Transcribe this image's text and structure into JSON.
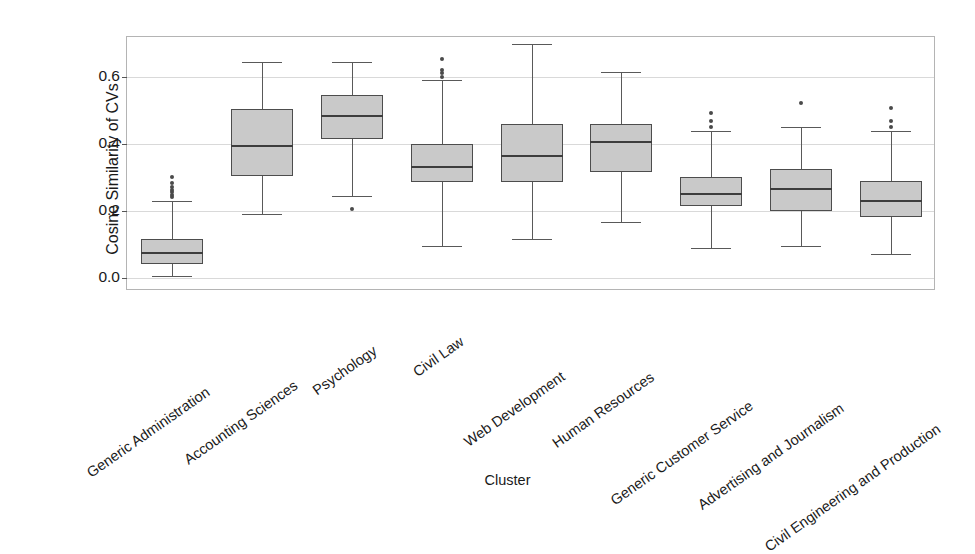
{
  "chart_data": {
    "type": "box",
    "title": "",
    "xlabel": "Cluster",
    "ylabel": "Cosine Similarity of CVs",
    "ylim": [
      -0.04,
      0.72
    ],
    "yticks": [
      0.0,
      0.2,
      0.4,
      0.6
    ],
    "ytick_labels": [
      "0.0",
      "0.2",
      "0.4",
      "0.6"
    ],
    "grid": true,
    "grid_axis": "y",
    "legend": "none",
    "xtick_rotation": -35,
    "categories": [
      "Generic Administration",
      "Accounting Sciences",
      "Psychology",
      "Civil Law",
      "Web Development",
      "Human Resources",
      "Generic Customer Service",
      "Advertising and Journalism",
      "Civil Engineering and Production"
    ],
    "boxes": [
      {
        "category": "Generic Administration",
        "whisker_low": 0.005,
        "q1": 0.04,
        "median": 0.075,
        "q3": 0.115,
        "whisker_high": 0.23,
        "fliers": [
          0.24,
          0.248,
          0.255,
          0.262,
          0.27,
          0.282,
          0.3
        ]
      },
      {
        "category": "Accounting Sciences",
        "whisker_low": 0.19,
        "q1": 0.305,
        "median": 0.395,
        "q3": 0.505,
        "whisker_high": 0.645,
        "fliers": []
      },
      {
        "category": "Psychology",
        "whisker_low": 0.245,
        "q1": 0.415,
        "median": 0.485,
        "q3": 0.545,
        "whisker_high": 0.645,
        "fliers": [
          0.205
        ]
      },
      {
        "category": "Civil Law",
        "whisker_low": 0.095,
        "q1": 0.285,
        "median": 0.33,
        "q3": 0.4,
        "whisker_high": 0.59,
        "fliers": [
          0.6,
          0.612,
          0.62,
          0.655
        ]
      },
      {
        "category": "Web Development",
        "whisker_low": 0.115,
        "q1": 0.285,
        "median": 0.365,
        "q3": 0.46,
        "whisker_high": 0.7,
        "fliers": []
      },
      {
        "category": "Human Resources",
        "whisker_low": 0.165,
        "q1": 0.315,
        "median": 0.405,
        "q3": 0.46,
        "whisker_high": 0.615,
        "fliers": []
      },
      {
        "category": "Generic Customer Service",
        "whisker_low": 0.09,
        "q1": 0.215,
        "median": 0.25,
        "q3": 0.3,
        "whisker_high": 0.44,
        "fliers": [
          0.452,
          0.47,
          0.492
        ]
      },
      {
        "category": "Advertising and Journalism",
        "whisker_low": 0.095,
        "q1": 0.2,
        "median": 0.265,
        "q3": 0.325,
        "whisker_high": 0.45,
        "fliers": [
          0.522
        ]
      },
      {
        "category": "Civil Engineering and Production",
        "whisker_low": 0.07,
        "q1": 0.18,
        "median": 0.23,
        "q3": 0.29,
        "whisker_high": 0.44,
        "fliers": [
          0.452,
          0.47,
          0.508
        ]
      }
    ],
    "colors": {
      "box_fill": "#c9c9c9",
      "box_edge": "#4d4d4d",
      "median": "#3d3d3d",
      "whisker": "#595959",
      "flier": "#4a4a4a",
      "grid": "#d9d9d9",
      "axis": "#b4b4b4",
      "text": "#1a1a1a",
      "background": "#ffffff"
    }
  }
}
